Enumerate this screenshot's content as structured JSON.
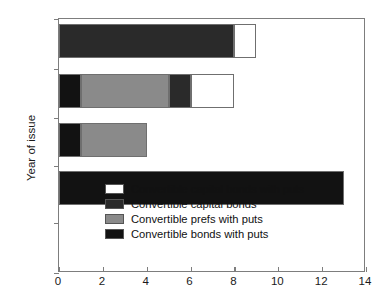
{
  "chart_data": {
    "type": "bar",
    "orientation": "horizontal",
    "stacked": true,
    "title": "",
    "xlabel": "",
    "ylabel": "Year of issue",
    "categories": [
      "1990",
      "1989",
      "1988",
      "1987",
      "1986",
      "1985"
    ],
    "xlim": [
      0,
      14
    ],
    "xticks": [
      0,
      2,
      4,
      6,
      8,
      10,
      12,
      14
    ],
    "xtick_labels": [
      "0",
      "2",
      "4",
      "6",
      "8",
      "10",
      "12",
      "14"
    ],
    "ytick_labels": [
      "1990",
      "1989",
      "1988",
      "1987",
      "1986",
      "1985"
    ],
    "grid": false,
    "legend_position": "lower center",
    "series": [
      {
        "name": "Convertible capital bonds with puts",
        "color": "#ffffff",
        "values": [
          1,
          2,
          0,
          0,
          0,
          0
        ]
      },
      {
        "name": "Convertible capital bonds",
        "color": "#2a2a2a",
        "values": [
          8,
          1,
          0,
          0,
          0,
          0
        ]
      },
      {
        "name": "Convertible prefs with puts",
        "color": "#8a8a8a",
        "values": [
          0,
          4,
          3,
          0,
          0,
          0
        ]
      },
      {
        "name": "Convertible bonds with puts",
        "color": "#121212",
        "values": [
          0,
          1,
          1,
          13,
          0,
          0
        ]
      }
    ],
    "bars": [
      {
        "year": "1990",
        "total": 9,
        "segments": [
          {
            "series": "Convertible capital bonds",
            "start": 0,
            "end": 8,
            "value": 8,
            "color": "#2a2a2a"
          },
          {
            "series": "Convertible capital bonds with puts",
            "start": 8,
            "end": 9,
            "value": 1,
            "color": "#ffffff"
          }
        ]
      },
      {
        "year": "1989",
        "total": 8,
        "segments": [
          {
            "series": "Convertible bonds with puts",
            "start": 0,
            "end": 1,
            "value": 1,
            "color": "#121212"
          },
          {
            "series": "Convertible prefs with puts",
            "start": 1,
            "end": 5,
            "value": 4,
            "color": "#8a8a8a"
          },
          {
            "series": "Convertible capital bonds",
            "start": 5,
            "end": 6,
            "value": 1,
            "color": "#2a2a2a"
          },
          {
            "series": "Convertible capital bonds with puts",
            "start": 6,
            "end": 8,
            "value": 2,
            "color": "#ffffff"
          }
        ]
      },
      {
        "year": "1988",
        "total": 4,
        "segments": [
          {
            "series": "Convertible bonds with puts",
            "start": 0,
            "end": 1,
            "value": 1,
            "color": "#121212"
          },
          {
            "series": "Convertible prefs with puts",
            "start": 1,
            "end": 4,
            "value": 3,
            "color": "#8a8a8a"
          }
        ]
      },
      {
        "year": "1987",
        "total": 13,
        "segments": [
          {
            "series": "Convertible bonds with puts",
            "start": 0,
            "end": 13,
            "value": 13,
            "color": "#121212"
          }
        ]
      },
      {
        "year": "1986",
        "total": 0,
        "segments": []
      },
      {
        "year": "1985",
        "total": 0,
        "segments": []
      }
    ],
    "legend": [
      {
        "label": "Convertible capital bonds with puts",
        "color": "#ffffff"
      },
      {
        "label": "Convertible capital bonds",
        "color": "#2a2a2a"
      },
      {
        "label": "Convertible prefs with puts",
        "color": "#8a8a8a"
      },
      {
        "label": "Convertible bonds with puts",
        "color": "#121212"
      }
    ]
  }
}
